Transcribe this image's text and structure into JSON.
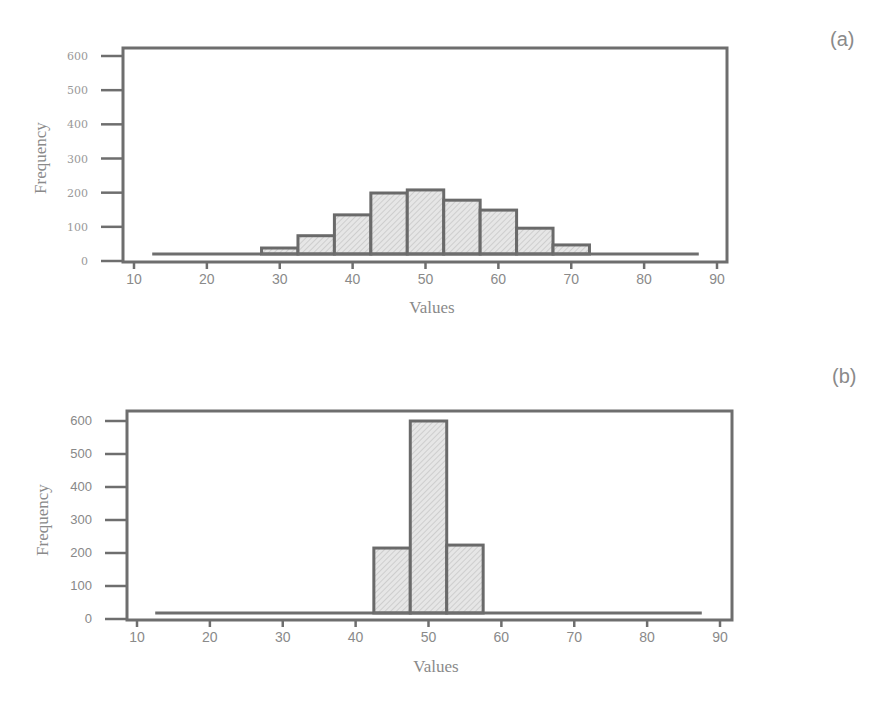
{
  "panels": {
    "a": {
      "label": "(a)"
    },
    "b": {
      "label": "(b)"
    }
  },
  "chart_data": [
    {
      "type": "bar",
      "panel": "(a)",
      "title": "",
      "xlabel": "Values",
      "ylabel": "Frequency",
      "xlim": [
        10,
        90
      ],
      "ylim": [
        0,
        600
      ],
      "xticks": [
        10,
        20,
        30,
        40,
        50,
        60,
        70,
        80,
        90
      ],
      "yticks": [
        0,
        100,
        200,
        300,
        400,
        500,
        600
      ],
      "grid": false,
      "bin_width": 5,
      "bins": [
        {
          "start": 12.5,
          "end": 27.5,
          "value": 0
        },
        {
          "start": 27.5,
          "end": 32.5,
          "value": 38
        },
        {
          "start": 32.5,
          "end": 37.5,
          "value": 74
        },
        {
          "start": 37.5,
          "end": 42.5,
          "value": 135
        },
        {
          "start": 42.5,
          "end": 47.5,
          "value": 199
        },
        {
          "start": 47.5,
          "end": 52.5,
          "value": 208
        },
        {
          "start": 52.5,
          "end": 57.5,
          "value": 178
        },
        {
          "start": 57.5,
          "end": 62.5,
          "value": 149
        },
        {
          "start": 62.5,
          "end": 67.5,
          "value": 96
        },
        {
          "start": 67.5,
          "end": 72.5,
          "value": 47
        },
        {
          "start": 72.5,
          "end": 87.5,
          "value": 0
        }
      ],
      "categories": [
        "30",
        "35",
        "40",
        "45",
        "50",
        "55",
        "60",
        "65",
        "70"
      ],
      "values": [
        38,
        74,
        135,
        199,
        208,
        178,
        149,
        96,
        47
      ]
    },
    {
      "type": "bar",
      "panel": "(b)",
      "title": "",
      "xlabel": "Values",
      "ylabel": "Frequency",
      "xlim": [
        10,
        90
      ],
      "ylim": [
        0,
        600
      ],
      "xticks": [
        10,
        20,
        30,
        40,
        50,
        60,
        70,
        80,
        90
      ],
      "yticks": [
        0,
        100,
        200,
        300,
        400,
        500,
        600
      ],
      "grid": false,
      "bin_width": 5,
      "bins": [
        {
          "start": 12.5,
          "end": 42.5,
          "value": 0
        },
        {
          "start": 42.5,
          "end": 47.5,
          "value": 215
        },
        {
          "start": 47.5,
          "end": 52.5,
          "value": 600
        },
        {
          "start": 52.5,
          "end": 57.5,
          "value": 224
        },
        {
          "start": 57.5,
          "end": 87.5,
          "value": 0
        }
      ],
      "categories": [
        "45",
        "50",
        "55"
      ],
      "values": [
        215,
        600,
        224
      ]
    }
  ]
}
